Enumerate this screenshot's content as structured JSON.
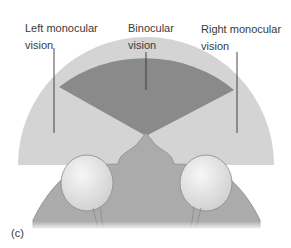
{
  "figure": {
    "panel_label": "(c)",
    "labels": {
      "left": {
        "line1": "Left monocular",
        "line2": "vision"
      },
      "center": {
        "line1": "Binocular",
        "line2": "vision"
      },
      "right": {
        "line1": "Right monocular",
        "line2": "vision"
      }
    },
    "colors": {
      "monocular_field": "#d4d4d4",
      "binocular_field": "#8a8a8a",
      "head": "#ababab",
      "eye": "#e6e6e6",
      "leader_line": "#333333"
    }
  }
}
